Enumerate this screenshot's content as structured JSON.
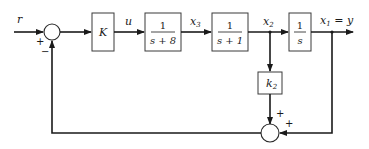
{
  "diagram": {
    "type": "block-diagram",
    "signals": {
      "input": "r",
      "control": "u",
      "x3": {
        "base": "x",
        "sub": "3"
      },
      "x2": {
        "base": "x",
        "sub": "2"
      },
      "output": {
        "base": "x",
        "sub": "1",
        "suffix": " = y"
      }
    },
    "blocks": [
      {
        "id": "gain-K",
        "label": "K"
      },
      {
        "id": "tf-s-plus-8",
        "numerator": "1",
        "denominator": "s + 8"
      },
      {
        "id": "tf-s-plus-1",
        "numerator": "1",
        "denominator": "s + 1"
      },
      {
        "id": "integrator",
        "numerator": "1",
        "denominator": "s"
      },
      {
        "id": "gain-k2",
        "label": {
          "base": "k",
          "sub": "2"
        }
      }
    ],
    "summing_junctions": [
      {
        "id": "main-sum",
        "signs": {
          "left": "+",
          "bottom": "−"
        }
      },
      {
        "id": "feedback-sum",
        "signs": {
          "top": "+",
          "right": "+"
        }
      }
    ],
    "colors": {
      "line": "#1a1a1a",
      "background": "#ffffff"
    }
  }
}
